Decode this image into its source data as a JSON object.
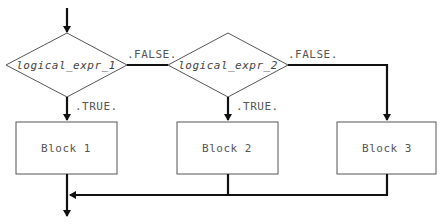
{
  "diagram": {
    "type": "flowchart",
    "title": "",
    "decisions": [
      {
        "id": "d1",
        "label": "logical_expr_1",
        "true_label": ".TRUE.",
        "false_label": ".FALSE."
      },
      {
        "id": "d2",
        "label": "logical_expr_2",
        "true_label": ".TRUE.",
        "false_label": ".FALSE."
      }
    ],
    "blocks": [
      {
        "id": "b1",
        "label": "Block 1"
      },
      {
        "id": "b2",
        "label": "Block 2"
      },
      {
        "id": "b3",
        "label": "Block 3"
      }
    ],
    "edges": [
      {
        "from": "entry",
        "to": "d1"
      },
      {
        "from": "d1",
        "to": "b1",
        "label": ".TRUE."
      },
      {
        "from": "d1",
        "to": "d2",
        "label": ".FALSE."
      },
      {
        "from": "d2",
        "to": "b2",
        "label": ".TRUE."
      },
      {
        "from": "d2",
        "to": "b3",
        "label": ".FALSE."
      },
      {
        "from": "b1",
        "to": "exit"
      },
      {
        "from": "b2",
        "to": "exit"
      },
      {
        "from": "b3",
        "to": "exit"
      }
    ],
    "colors": {
      "line": "#111111",
      "shape_border": "#555555",
      "text": "#555555"
    }
  }
}
